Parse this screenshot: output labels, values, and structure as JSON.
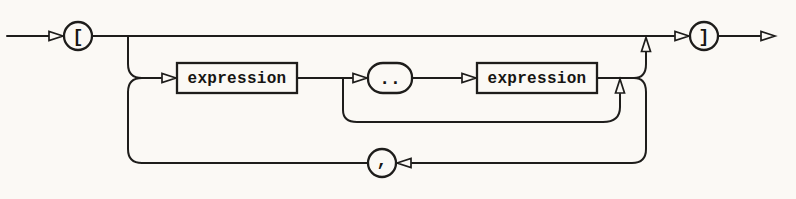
{
  "colors": {
    "paper": "#fbf9f5",
    "ink": "#1e1d1b"
  },
  "diagram": {
    "type": "railroad-syntax-diagram",
    "nodes": {
      "open_bracket": {
        "label": "[",
        "shape": "circle-terminal"
      },
      "expression_1": {
        "label": "expression",
        "shape": "rectangle-nonterminal"
      },
      "range_dots": {
        "label": "..",
        "shape": "rounded-terminal"
      },
      "expression_2": {
        "label": "expression",
        "shape": "rectangle-nonterminal"
      },
      "comma": {
        "label": ",",
        "shape": "circle-terminal"
      },
      "close_bracket": {
        "label": "]",
        "shape": "circle-terminal"
      }
    }
  }
}
